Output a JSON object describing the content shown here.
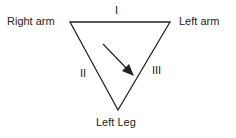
{
  "diagram": {
    "vertices": {
      "right_arm": "Right arm",
      "left_arm": "Left arm",
      "left_leg": "Left Leg"
    },
    "leads": {
      "lead_1": "I",
      "lead_2": "II",
      "lead_3": "III"
    },
    "arrow": "mean electrical axis",
    "colors": {
      "line": "#222222",
      "text": "#222222",
      "background": "#ffffff"
    }
  }
}
